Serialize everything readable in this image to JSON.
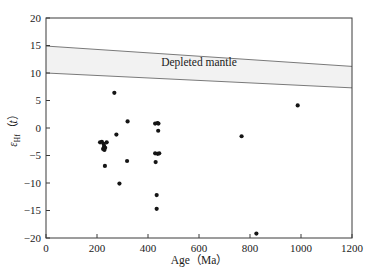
{
  "chart_data": {
    "type": "scatter",
    "title": "",
    "xlabel": "Age（Ma）",
    "ylabel": "εHf（t）",
    "xlim": [
      0,
      1200
    ],
    "ylim": [
      -20,
      20
    ],
    "xticks": [
      0,
      200,
      400,
      600,
      800,
      1000,
      1200
    ],
    "yticks": [
      -20,
      -15,
      -10,
      -5,
      0,
      5,
      10,
      15,
      20
    ],
    "xtick_labels": [
      "0",
      "200",
      "400",
      "600",
      "800",
      "1000",
      "1200"
    ],
    "ytick_labels": [
      "-20",
      "-15",
      "-10",
      "-5",
      "0",
      "5",
      "10",
      "15",
      "20"
    ],
    "grid": false,
    "legend": false,
    "series": [
      {
        "name": "Zircon Hf isotope analyses",
        "marker": "filled-circle",
        "color": "#151515",
        "points": [
          {
            "x": 212,
            "y": -2.6
          },
          {
            "x": 219,
            "y": -2.5
          },
          {
            "x": 226,
            "y": -2.9
          },
          {
            "x": 228,
            "y": -3.3
          },
          {
            "x": 224,
            "y": -3.8
          },
          {
            "x": 229,
            "y": -4.0
          },
          {
            "x": 232,
            "y": -3.6
          },
          {
            "x": 238,
            "y": -2.6
          },
          {
            "x": 231,
            "y": -6.9
          },
          {
            "x": 268,
            "y": 6.4
          },
          {
            "x": 276,
            "y": -1.2
          },
          {
            "x": 288,
            "y": -10.1
          },
          {
            "x": 320,
            "y": 1.2
          },
          {
            "x": 318,
            "y": -6.0
          },
          {
            "x": 428,
            "y": 0.8
          },
          {
            "x": 437,
            "y": 0.9
          },
          {
            "x": 441,
            "y": 0.8
          },
          {
            "x": 440,
            "y": -0.5
          },
          {
            "x": 428,
            "y": -4.6
          },
          {
            "x": 438,
            "y": -4.7
          },
          {
            "x": 444,
            "y": -4.6
          },
          {
            "x": 430,
            "y": -6.2
          },
          {
            "x": 434,
            "y": -12.2
          },
          {
            "x": 434,
            "y": -14.7
          },
          {
            "x": 767,
            "y": -1.5
          },
          {
            "x": 825,
            "y": -19.2
          },
          {
            "x": 987,
            "y": 4.1
          }
        ]
      }
    ],
    "bands": [
      {
        "name": "Depleted mantle",
        "label": "Depleted mantle",
        "fill_color": "#f2f2f2",
        "edge_color": "#7a7a7a",
        "upper_line": [
          {
            "x": 0,
            "y": 14.9
          },
          {
            "x": 1200,
            "y": 11.2
          }
        ],
        "lower_line": [
          {
            "x": 0,
            "y": 10.0
          },
          {
            "x": 1200,
            "y": 7.3
          }
        ]
      }
    ]
  },
  "labels": {
    "band_label": "Depleted mantle",
    "x_axis_title": "Age（Ma）",
    "y_axis_eps": "ε",
    "y_axis_sub": "Hf",
    "y_axis_paren_open": "（",
    "y_axis_var": "t",
    "y_axis_paren_close": "）"
  }
}
